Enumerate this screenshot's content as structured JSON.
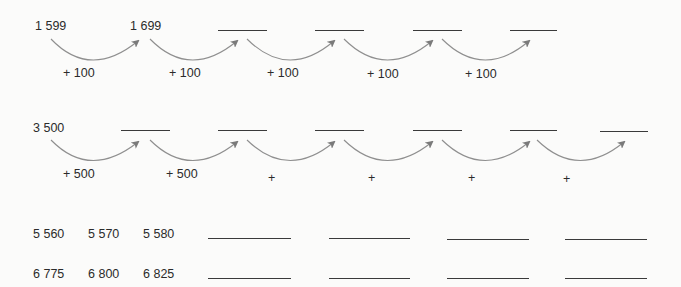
{
  "row1": {
    "start": "1 599",
    "second": "1 699",
    "step_labels": [
      "+ 100",
      "+ 100",
      "+ 100",
      "+ 100",
      "+ 100"
    ],
    "blanks": 4
  },
  "row2": {
    "start": "3 500",
    "step_labels": [
      "+ 500",
      "+ 500",
      "+",
      "+",
      "+",
      "+"
    ],
    "blanks": 6
  },
  "row3": {
    "values": [
      "5 560",
      "5 570",
      "5 580"
    ],
    "blanks": 4
  },
  "row4": {
    "values": [
      "6 775",
      "6 800",
      "6 825"
    ],
    "blanks": 4
  },
  "colors": {
    "arc": "#8a8a8a",
    "text": "#2b2b2b",
    "line": "#3a3a3a"
  }
}
